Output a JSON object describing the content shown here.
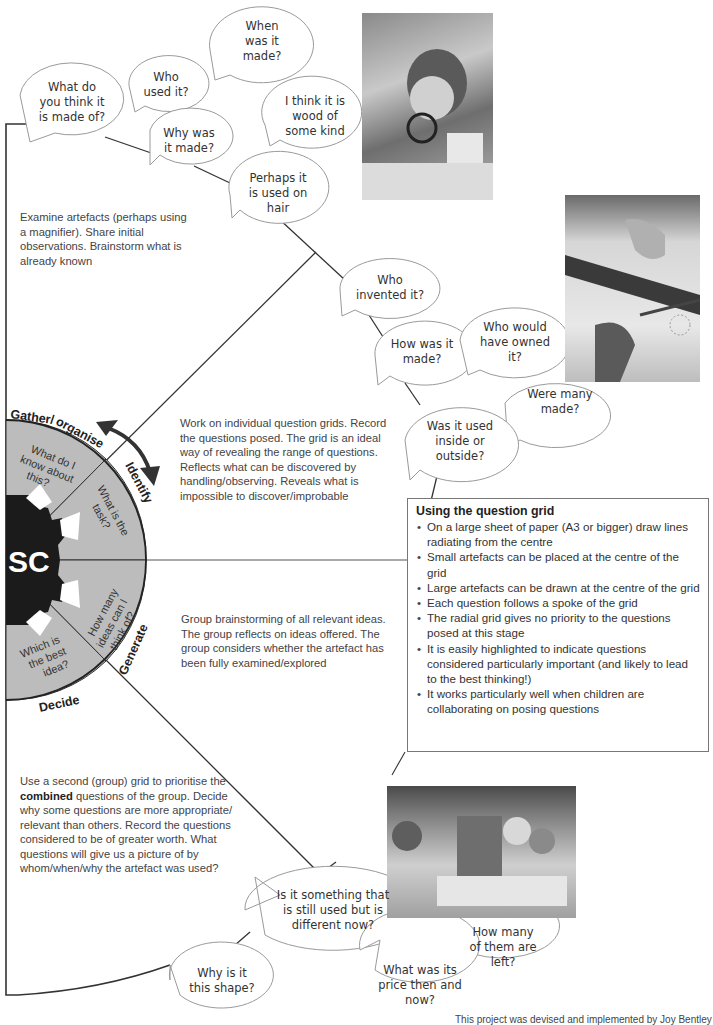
{
  "diagram": {
    "hub": {
      "label": "SC",
      "stages": [
        {
          "name": "Gather/organise",
          "question": "What do I know about this?"
        },
        {
          "name": "Identify",
          "question": "What is the task?"
        },
        {
          "name": "Generate",
          "question": "How many ideas can I think of?"
        },
        {
          "name": "Decide",
          "question": "Which is the best idea?"
        }
      ],
      "fill_color": "#b9b9b9",
      "hub_color": "#1a1a1a"
    },
    "notes": {
      "examine": "Examine artefacts (perhaps using a magnifier). Share initial observations. Brainstorm what is already known",
      "individual": "Work on individual question grids. Record the questions posed. The grid is an ideal way of revealing the range of questions. Reflects what can be discovered by handling/observing. Reveals what is impossible to discover/improbable",
      "group_brainstorm": "Group brainstorming of all relevant ideas. The group reflects on ideas offered. The group considers whether the artefact has been fully examined/explored",
      "second_grid_before": "Use a second (group) grid to prioritise the ",
      "second_grid_bold": "combined",
      "second_grid_after": " questions of the group. Decide why some questions are more appropriate/ relevant than others. Record the questions considered to be of greater worth. What questions will give us a picture of by whom/when/why the artefact was used?"
    },
    "bubbles": {
      "when_made": "When\nwas it\nmade?",
      "who_used": "Who\nused it?",
      "made_of": "What do\nyou think it\nis made of?",
      "why_made": "Why was\nit made?",
      "wood": "I think it is\nwood of\nsome kind",
      "hair": "Perhaps it\nis used on\nhair",
      "invented": "Who\ninvented it?",
      "how_made": "How was it\nmade?",
      "owned": "Who would\nhave owned\nit?",
      "many_made": "Were many\nmade?",
      "inside_outside": "Was it used\ninside or\noutside?",
      "still_used": "Is it something that\nis still used but is\ndifferent now?",
      "how_many_left": "How many\nof them are\nleft?",
      "shape": "Why is it\nthis shape?",
      "price": "What was its\nprice then and\nnow?"
    },
    "photos": [
      {
        "name": "child-with-magnifier-photo"
      },
      {
        "name": "hands-drawing-grid-photo"
      },
      {
        "name": "group-discussion-photo"
      }
    ]
  },
  "infobox": {
    "title": "Using the question grid",
    "items": [
      "On a large sheet of paper (A3 or bigger) draw lines radiating from the centre",
      "Small artefacts can be placed at the centre of the grid",
      "Large artefacts can be drawn at the centre of the grid",
      "Each question follows a spoke of the grid",
      "The radial grid gives no priority to the questions posed at this stage",
      "It is easily highlighted to indicate questions considered particularly important (and likely to lead to the best thinking!)",
      "It works particularly well when children are collaborating on posing questions"
    ]
  },
  "footer": "This project was devised and implemented by Joy Bentley"
}
